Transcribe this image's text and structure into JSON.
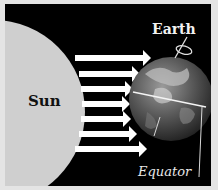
{
  "diagram": {
    "labels": {
      "sun": "Sun",
      "earth": "Earth",
      "equator": "Equator"
    },
    "arrows": {
      "count": 7,
      "direction": "sun-to-earth",
      "label": "sunlight"
    },
    "colors": {
      "background": "#000000",
      "border": "#e4e4e4",
      "sun": "#cfcfcf",
      "arrows": "#ffffff",
      "text_light": "#f2f2f2",
      "text_dark": "#111111"
    }
  }
}
